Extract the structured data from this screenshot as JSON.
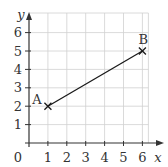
{
  "chart_data": {
    "type": "line",
    "title": "",
    "xlabel": "x",
    "ylabel": "y",
    "xlim": [
      0,
      6
    ],
    "ylim": [
      0,
      6
    ],
    "grid": true,
    "x_ticks": [
      "0",
      "1",
      "2",
      "3",
      "4",
      "5",
      "6"
    ],
    "y_ticks": [
      "1",
      "2",
      "3",
      "4",
      "5",
      "6"
    ],
    "series": [
      {
        "name": "segment AB",
        "points": [
          {
            "label": "A",
            "x": 1,
            "y": 2
          },
          {
            "label": "B",
            "x": 6,
            "y": 5
          }
        ],
        "marker": "x",
        "color": "#1a1a1a"
      }
    ],
    "colors": {
      "grid": "#d0d0d0",
      "axis": "#333333",
      "line": "#1a1a1a"
    }
  }
}
